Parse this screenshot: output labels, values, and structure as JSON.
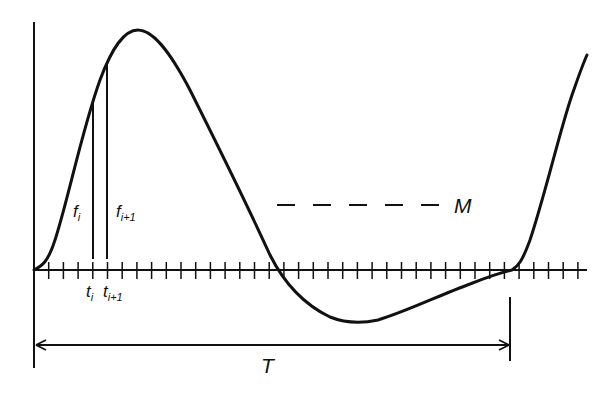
{
  "diagram": {
    "colors": {
      "stroke": "#111111",
      "background": "#ffffff"
    },
    "labels": {
      "f_i": {
        "base": "f",
        "sub": "i"
      },
      "f_i1": {
        "base": "f",
        "sub": "i+1"
      },
      "t_i": {
        "base": "t",
        "sub": "i"
      },
      "t_i1": {
        "base": "t",
        "sub": "i+1"
      },
      "mean": "M",
      "period": "T"
    },
    "axis": {
      "tick_count": 37,
      "tick_spacing_px": 14.7
    }
  }
}
